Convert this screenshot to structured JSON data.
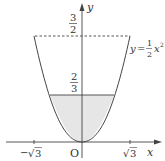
{
  "diagram": {
    "type": "function-graph",
    "curve": {
      "equation_label": "y = 1/2 x^2",
      "lhs": "y",
      "equals": "=",
      "coef_num": "1",
      "coef_den": "2",
      "var": "x",
      "exp": "2",
      "x_range": [
        -1.732,
        1.732
      ]
    },
    "axes": {
      "x_label": "x",
      "y_label": "y",
      "origin_label": "O"
    },
    "x_ticks": [
      {
        "value": -1.732,
        "label_sign": "−",
        "label_root": "√",
        "label_radicand": "3"
      },
      {
        "value": 1.732,
        "label_sign": "",
        "label_root": "√",
        "label_radicand": "3"
      }
    ],
    "y_marks": {
      "upper": {
        "value": 1.5,
        "num": "3",
        "den": "2",
        "style": "dashed"
      },
      "lower": {
        "value": 0.6667,
        "num": "2",
        "den": "3",
        "style": "solid"
      }
    },
    "shaded_region": {
      "description": "region between parabola and y = 2/3",
      "fill": "#e6e6e6"
    },
    "colors": {
      "stroke": "#444444",
      "shade": "#e6e6e6",
      "background": "#ffffff"
    }
  }
}
